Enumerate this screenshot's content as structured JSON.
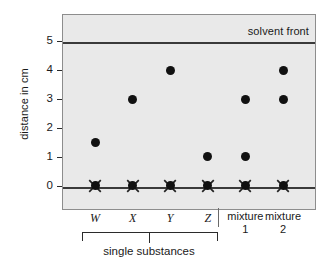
{
  "chart_data": {
    "type": "scatter",
    "title": "",
    "xlabel": "",
    "ylabel": "distance in cm",
    "ylim": [
      -0.85,
      5.95
    ],
    "yticks": [
      0,
      1,
      2,
      3,
      4,
      5
    ],
    "ytick_labels": [
      "0",
      "1",
      "2",
      "3",
      "4",
      "5"
    ],
    "grid": false,
    "legend": "none",
    "annotations": [
      {
        "name": "solvent-front",
        "text": "solvent front",
        "y": 5,
        "position": "right-above-line"
      },
      {
        "name": "baseline",
        "text": "",
        "y": 0,
        "position": "line"
      }
    ],
    "lines": [
      {
        "name": "solvent-front-line",
        "y": 5
      },
      {
        "name": "origin-baseline",
        "y": 0
      }
    ],
    "categories": [
      "W",
      "X",
      "Y",
      "Z",
      "mixture 1",
      "mixture 2"
    ],
    "lanes": [
      {
        "label": "W",
        "label_line1": "W",
        "label_line2": "",
        "italic": true,
        "origin": 0,
        "spots": [
          1.5
        ]
      },
      {
        "label": "X",
        "label_line1": "X",
        "label_line2": "",
        "italic": true,
        "origin": 0,
        "spots": [
          3.0
        ]
      },
      {
        "label": "Y",
        "label_line1": "Y",
        "label_line2": "",
        "italic": true,
        "origin": 0,
        "spots": [
          4.0
        ]
      },
      {
        "label": "Z",
        "label_line1": "Z",
        "label_line2": "",
        "italic": true,
        "origin": 0,
        "spots": [
          1.0
        ]
      },
      {
        "label": "mixture 1",
        "label_line1": "mixture",
        "label_line2": "1",
        "italic": false,
        "origin": 0,
        "spots": [
          1.0,
          3.0
        ]
      },
      {
        "label": "mixture 2",
        "label_line1": "mixture",
        "label_line2": "2",
        "italic": false,
        "origin": 0,
        "spots": [
          3.0,
          4.0
        ]
      }
    ],
    "group_bracket": {
      "label": "single substances",
      "covers": [
        "W",
        "X",
        "Y",
        "Z"
      ]
    }
  },
  "colors": {
    "plot_background": "#e9e9e9",
    "page_background": "#ffffff",
    "spot": "#111111",
    "line": "#3a3a3a",
    "frame": "#8d8d8d",
    "text": "#1a1a1a"
  }
}
